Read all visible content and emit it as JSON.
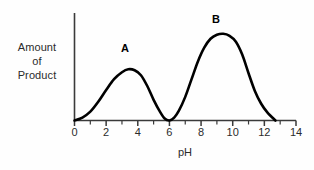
{
  "chart_data": {
    "type": "line",
    "title": "",
    "xlabel": "pH",
    "ylabel_lines": [
      "Amount",
      "of",
      "Product"
    ],
    "ylabel": "Amount of Product",
    "xlim": [
      0,
      14
    ],
    "ylim": [
      0,
      1
    ],
    "grid": false,
    "legend": "none",
    "axis_color": "#000000",
    "line_color": "#000000",
    "background_color": "#ffffff",
    "x_ticks_major": [
      0,
      2,
      4,
      6,
      8,
      10,
      12,
      14
    ],
    "x_tick_labels": [
      "0",
      "2",
      "4",
      "6",
      "8",
      "10",
      "12",
      "14"
    ],
    "x_ticks_minor": [
      1,
      3,
      5,
      7,
      9,
      11,
      13
    ],
    "y_ticks": [],
    "y_tick_labels": [],
    "annotations": [
      {
        "text": "A",
        "x": 3.4,
        "y": 0.56,
        "note": "label above first peak"
      },
      {
        "text": "B",
        "x": 9.4,
        "y": 0.98,
        "note": "label above second peak"
      }
    ],
    "series": [
      {
        "name": "Amount of Product",
        "x": [
          0.0,
          0.5,
          1.0,
          1.5,
          2.0,
          2.5,
          3.0,
          3.4,
          3.8,
          4.2,
          4.6,
          5.0,
          5.4,
          5.7,
          6.0,
          6.3,
          6.6,
          7.0,
          7.4,
          7.8,
          8.2,
          8.6,
          9.0,
          9.4,
          9.8,
          10.2,
          10.6,
          11.0,
          11.4,
          11.8,
          12.2,
          12.7
        ],
        "y": [
          0.0,
          0.03,
          0.09,
          0.19,
          0.31,
          0.42,
          0.49,
          0.52,
          0.51,
          0.46,
          0.35,
          0.21,
          0.09,
          0.02,
          0.0,
          0.03,
          0.1,
          0.24,
          0.42,
          0.6,
          0.74,
          0.83,
          0.87,
          0.88,
          0.86,
          0.8,
          0.67,
          0.48,
          0.3,
          0.17,
          0.08,
          0.0
        ]
      }
    ],
    "peaks": [
      {
        "label": "A",
        "ph": 3.4,
        "relative_height": 0.52
      },
      {
        "label": "B",
        "ph": 9.4,
        "relative_height": 0.88
      }
    ],
    "valley": {
      "ph": 6.0,
      "relative_height": 0.0
    },
    "curve_start_ph": 0.0,
    "curve_end_ph": 12.7
  }
}
